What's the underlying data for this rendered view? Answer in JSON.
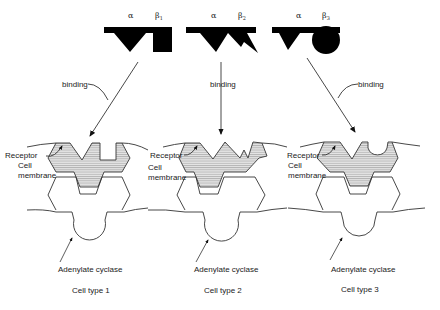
{
  "diagram": {
    "hormones": [
      {
        "alpha_label": "α",
        "beta_label": "β",
        "beta_sub": "1",
        "beta_shape": "square"
      },
      {
        "alpha_label": "α",
        "beta_label": "β",
        "beta_sub": "2",
        "beta_shape": "zigzag"
      },
      {
        "alpha_label": "α",
        "beta_label": "β",
        "beta_sub": "3",
        "beta_shape": "circle"
      }
    ],
    "arrows": {
      "binding_label": "binding"
    },
    "labels": {
      "receptor": "Receptor",
      "cell_membrane_line1": "Cell",
      "cell_membrane_line2": "membrane",
      "adenylate_cyclase": "Adenylate cyclase"
    },
    "cells": [
      {
        "caption": "Cell type 1"
      },
      {
        "caption": "Cell type 2"
      },
      {
        "caption": "Cell type 3"
      }
    ],
    "colors": {
      "hormone_fill": "#000000",
      "line": "#333333",
      "receptor_hatch": "#999999",
      "receptor_bg": "#d9d9d9"
    }
  }
}
